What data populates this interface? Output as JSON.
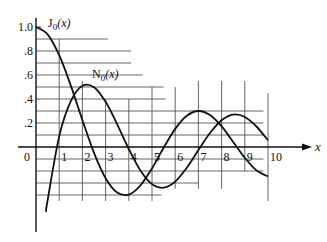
{
  "chart_data": {
    "type": "line",
    "title": "",
    "xlabel": "x",
    "ylabel": "",
    "xlim": [
      0,
      10
    ],
    "ylim": [
      -0.6,
      1.0
    ],
    "grid": true,
    "legend_position": "inline-labels",
    "x_ticks": [
      "0",
      "1",
      "2",
      "3",
      "4",
      "5",
      "6",
      "7",
      "8",
      "9",
      "10"
    ],
    "y_ticks": [
      "1.0",
      ".8",
      ".6",
      ".4",
      ".2"
    ],
    "x": [
      0,
      0.5,
      1,
      1.5,
      2,
      2.5,
      3,
      3.5,
      4,
      4.5,
      5,
      5.5,
      6,
      6.5,
      7,
      7.5,
      8,
      8.5,
      9,
      9.5,
      10
    ],
    "series": [
      {
        "name": "J0(x)",
        "label_main": "J",
        "label_sub": "0",
        "label_arg": "(x)",
        "values": [
          1.0,
          0.938,
          0.765,
          0.512,
          0.224,
          -0.048,
          -0.26,
          -0.38,
          -0.397,
          -0.321,
          -0.178,
          -0.007,
          0.151,
          0.26,
          0.3,
          0.266,
          0.172,
          0.042,
          -0.09,
          -0.194,
          -0.246
        ]
      },
      {
        "name": "N0(x)",
        "label_main": "N",
        "label_sub": "0",
        "label_arg": "(x)",
        "x_start": 0.43,
        "values": [
          null,
          -0.445,
          0.088,
          0.382,
          0.51,
          0.498,
          0.377,
          0.189,
          -0.017,
          -0.195,
          -0.309,
          -0.339,
          -0.288,
          -0.173,
          -0.026,
          0.117,
          0.223,
          0.27,
          0.25,
          0.171,
          0.056
        ]
      }
    ],
    "annotations": [
      "J0(x)",
      "N0(x)"
    ]
  }
}
